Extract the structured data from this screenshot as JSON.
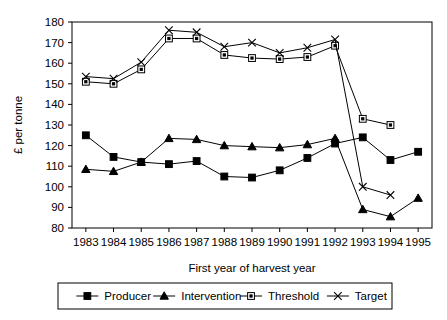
{
  "chart_data": {
    "type": "line",
    "title": "",
    "xlabel": "First year of harvest year",
    "ylabel": "£ per tonne",
    "categories": [
      1983,
      1984,
      1985,
      1986,
      1987,
      1988,
      1989,
      1990,
      1991,
      1992,
      1993,
      1994,
      1995
    ],
    "xtick_labels": [
      "1983",
      "1984",
      "1985",
      "1986",
      "1987",
      "1988",
      "1989",
      "1990",
      "1991",
      "1992",
      "1993",
      "1994",
      "1995"
    ],
    "ytick_labels": [
      "80",
      "90",
      "100",
      "110",
      "120",
      "130",
      "140",
      "150",
      "160",
      "170",
      "180"
    ],
    "ylim": [
      80,
      180
    ],
    "ytick_step": 10,
    "grid": false,
    "legend_position": "bottom",
    "series": [
      {
        "name": "Producer",
        "marker": "filled-square",
        "values": [
          125,
          114.5,
          112,
          111,
          112.5,
          105,
          104.5,
          108,
          114,
          121,
          124,
          113,
          117
        ]
      },
      {
        "name": "Intervention",
        "marker": "filled-triangle",
        "values": [
          108.5,
          107.5,
          112,
          123.5,
          123,
          120,
          119.5,
          119,
          120.5,
          123.5,
          89,
          85.5,
          94.5
        ]
      },
      {
        "name": "Threshold",
        "marker": "open-square",
        "values": [
          151,
          150,
          157,
          172,
          172,
          164,
          162.5,
          162,
          163,
          168.5,
          133,
          130,
          null
        ]
      },
      {
        "name": "Target",
        "marker": "cross",
        "values": [
          153.5,
          152.5,
          160.5,
          176,
          175,
          168,
          170,
          165,
          167.5,
          171.5,
          100,
          96,
          null
        ]
      }
    ]
  },
  "legend": {
    "entries": [
      {
        "label": "Producer",
        "marker": "filled-square"
      },
      {
        "label": "Intervention",
        "marker": "filled-triangle"
      },
      {
        "label": "Threshold",
        "marker": "open-square"
      },
      {
        "label": "Target",
        "marker": "cross"
      }
    ]
  }
}
